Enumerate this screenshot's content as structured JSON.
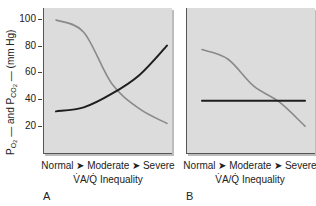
{
  "chart_data": [
    {
      "type": "line",
      "panel": "A",
      "title": "",
      "xlabel": "V̇A/Q̇ Inequality",
      "ylabel": "PO2 — and PCO2 — (mm Hg)",
      "categories": [
        "Normal",
        "Moderate",
        "Severe"
      ],
      "ylim": [
        0,
        108
      ],
      "yticks": [
        20,
        40,
        60,
        80,
        100
      ],
      "grid": false,
      "series": [
        {
          "name": "PO2",
          "color": "#8a8a8a",
          "x": [
            0,
            0.25,
            0.5,
            0.75,
            1.0
          ],
          "values": [
            99,
            90,
            52,
            33,
            22
          ]
        },
        {
          "name": "PCO2",
          "color": "#1e1e1e",
          "x": [
            0,
            0.25,
            0.5,
            0.75,
            1.0
          ],
          "values": [
            31,
            34,
            44,
            58,
            80
          ]
        }
      ]
    },
    {
      "type": "line",
      "panel": "B",
      "title": "",
      "xlabel": "V̇A/Q̇ Inequality",
      "ylabel": "PO2 — and PCO2 — (mm Hg)",
      "categories": [
        "Normal",
        "Moderate",
        "Severe"
      ],
      "ylim": [
        0,
        108
      ],
      "grid": false,
      "series": [
        {
          "name": "PO2",
          "color": "#8a8a8a",
          "x": [
            0,
            0.25,
            0.5,
            0.75,
            1.0
          ],
          "values": [
            77,
            70,
            50,
            38,
            20
          ]
        },
        {
          "name": "PCO2",
          "color": "#1e1e1e",
          "x": [
            0,
            1.0
          ],
          "values": [
            39,
            39
          ]
        }
      ]
    }
  ],
  "axis": {
    "y_label_po2": "PO",
    "y_label_po2_sub": "2",
    "y_label_and": " — and P",
    "y_label_pco2_sub": "CO",
    "y_label_pco2_sub2": "2",
    "y_label_unit": " — (mm Hg)",
    "yticks": [
      "100",
      "80",
      "60",
      "40",
      "20"
    ]
  },
  "panels": {
    "a": {
      "letter": "A",
      "xcats": "Normal ➤ Moderate ➤ Severe",
      "xtitle": "V̇A/Q̇ Inequality"
    },
    "b": {
      "letter": "B",
      "xcats": "Normal ➤ Moderate ➤ Severe",
      "xtitle": "V̇A/Q̇ Inequality"
    }
  }
}
